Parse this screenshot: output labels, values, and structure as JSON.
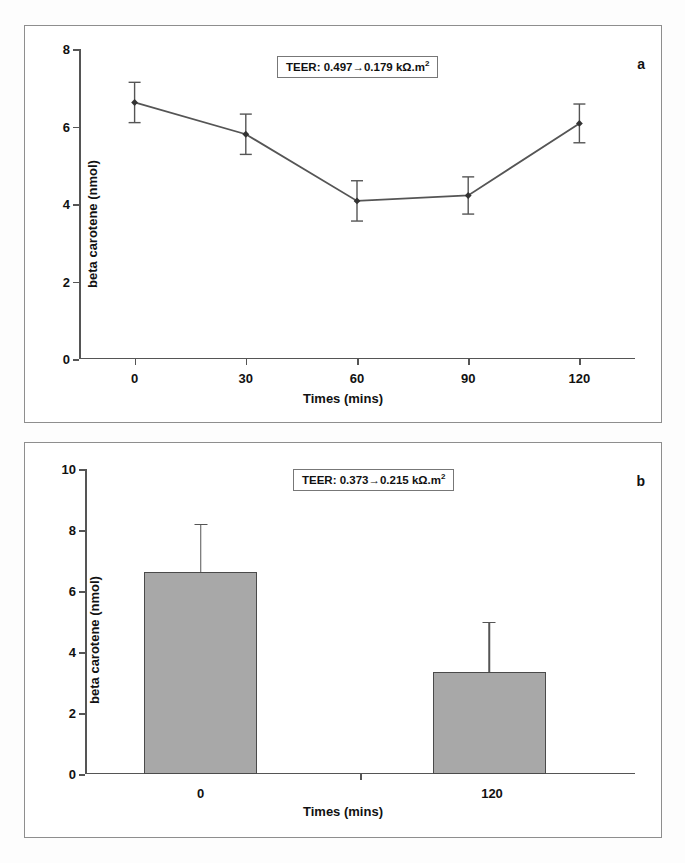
{
  "figure": {
    "panels": [
      {
        "letter": "a",
        "annotation": "TEER: 0.497→0.179 kΩ.m",
        "annotation_sup": "2",
        "ylabel": "beta carotene (nmol)",
        "xlabel": "Times (mins)",
        "yticks": [
          "8",
          "6",
          "4",
          "2",
          "0"
        ],
        "xticks": [
          "0",
          "30",
          "60",
          "90",
          "120"
        ]
      },
      {
        "letter": "b",
        "annotation": "TEER: 0.373→0.215 kΩ.m",
        "annotation_sup": "2",
        "ylabel": "beta carotene (nmol)",
        "xlabel": "Times (mins)",
        "yticks": [
          "10",
          "8",
          "6",
          "4",
          "2",
          "0"
        ],
        "xticks": [
          "0",
          "120"
        ]
      }
    ]
  },
  "chart_data": [
    {
      "type": "line",
      "panel": "a",
      "title": "",
      "annotation": "TEER: 0.497→0.179 kΩ.m2",
      "xlabel": "Times (mins)",
      "ylabel": "beta carotene (nmol)",
      "categories": [
        "0",
        "30",
        "60",
        "90",
        "120"
      ],
      "x": [
        0,
        30,
        60,
        90,
        120
      ],
      "values": [
        6.62,
        5.8,
        4.08,
        4.22,
        6.08
      ],
      "errors": [
        0.52,
        0.52,
        0.52,
        0.48,
        0.5
      ],
      "ylim": [
        0,
        8
      ],
      "yticks": [
        0,
        2,
        4,
        6,
        8
      ],
      "xlim": [
        -15,
        135
      ],
      "grid": false,
      "legend": null,
      "marker": "diamond",
      "line_color": "#555555"
    },
    {
      "type": "bar",
      "panel": "b",
      "title": "",
      "annotation": "TEER: 0.373→0.215 kΩ.m2",
      "xlabel": "Times (mins)",
      "ylabel": "beta carotene (nmol)",
      "categories": [
        "0",
        "120"
      ],
      "values": [
        6.62,
        3.35
      ],
      "errors": [
        1.58,
        1.65
      ],
      "ylim": [
        0,
        10
      ],
      "yticks": [
        0,
        2,
        4,
        6,
        8,
        10
      ],
      "grid": false,
      "legend": null,
      "bar_color": "#a8a8a8",
      "bar_edge_color": "#4a4a4a"
    }
  ]
}
